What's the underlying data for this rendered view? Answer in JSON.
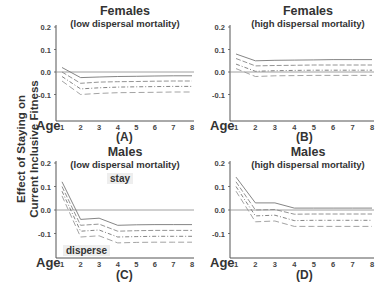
{
  "figure": {
    "y_axis_label_line1": "Effect of Staying on",
    "y_axis_label_line2": "Current Inclusive Fitness",
    "x_axis_label": "Age"
  },
  "panels": [
    {
      "title": "Females",
      "subtitle": "(low dispersal mortality)",
      "label": "(A)"
    },
    {
      "title": "Females",
      "subtitle": "(high dispersal mortality)",
      "label": "(B)"
    },
    {
      "title": "Males",
      "subtitle": "(low dispersal mortality)",
      "label": "(C)",
      "annotations": [
        "stay",
        "disperse"
      ]
    },
    {
      "title": "Males",
      "subtitle": "(high dispersal mortality)",
      "label": "(D)"
    }
  ],
  "chart_data": [
    {
      "type": "line",
      "title": "Females (low dispersal mortality)",
      "panel": "(A)",
      "xlabel": "Age",
      "ylabel": "Effect of Staying on Current Inclusive Fitness",
      "x": [
        1,
        2,
        3,
        4,
        5,
        6,
        7,
        8
      ],
      "xticks": [
        "1",
        "2",
        "3",
        "4",
        "5",
        "6",
        "7",
        "8"
      ],
      "yticks": [
        "0.2",
        "0.1",
        "0.0",
        "-0.1"
      ],
      "ylim": [
        -0.17,
        0.2
      ],
      "reference_line": 0.0,
      "series": [
        {
          "name": "line1",
          "style": "solid",
          "values": [
            0.02,
            -0.025,
            -0.022,
            -0.02,
            -0.019,
            -0.018,
            -0.017,
            -0.017
          ]
        },
        {
          "name": "line2",
          "style": "dashed",
          "values": [
            0.0,
            -0.05,
            -0.045,
            -0.043,
            -0.042,
            -0.041,
            -0.04,
            -0.04
          ]
        },
        {
          "name": "line3",
          "style": "dash-dot",
          "values": [
            -0.02,
            -0.075,
            -0.07,
            -0.067,
            -0.066,
            -0.065,
            -0.064,
            -0.064
          ]
        },
        {
          "name": "line4",
          "style": "long-dash",
          "values": [
            -0.04,
            -0.1,
            -0.095,
            -0.092,
            -0.091,
            -0.09,
            -0.089,
            -0.089
          ]
        }
      ]
    },
    {
      "type": "line",
      "title": "Females (high dispersal mortality)",
      "panel": "(B)",
      "xlabel": "Age",
      "ylabel": "Effect of Staying on Current Inclusive Fitness",
      "x": [
        1,
        2,
        3,
        4,
        5,
        6,
        7,
        8
      ],
      "xticks": [
        "1",
        "2",
        "3",
        "4",
        "5",
        "6",
        "7",
        "8"
      ],
      "yticks": [
        "0.2",
        "0.1",
        "0.0",
        "-0.1"
      ],
      "ylim": [
        -0.17,
        0.2
      ],
      "reference_line": 0.0,
      "series": [
        {
          "name": "line1",
          "style": "solid",
          "values": [
            0.08,
            0.05,
            0.052,
            0.053,
            0.054,
            0.055,
            0.055,
            0.055
          ]
        },
        {
          "name": "line2",
          "style": "dashed",
          "values": [
            0.06,
            0.027,
            0.029,
            0.03,
            0.031,
            0.031,
            0.031,
            0.031
          ]
        },
        {
          "name": "line3",
          "style": "dash-dot",
          "values": [
            0.035,
            0.003,
            0.006,
            0.007,
            0.008,
            0.008,
            0.008,
            0.008
          ]
        },
        {
          "name": "line4",
          "style": "long-dash",
          "values": [
            0.015,
            -0.02,
            -0.017,
            -0.016,
            -0.015,
            -0.015,
            -0.015,
            -0.015
          ]
        }
      ]
    },
    {
      "type": "line",
      "title": "Males (low dispersal mortality)",
      "panel": "(C)",
      "xlabel": "Age",
      "ylabel": "Effect of Staying on Current Inclusive Fitness",
      "x": [
        1,
        2,
        3,
        4,
        5,
        6,
        7,
        8
      ],
      "xticks": [
        "1",
        "2",
        "3",
        "4",
        "5",
        "6",
        "7",
        "8"
      ],
      "yticks": [
        "0.2",
        "0.1",
        "0.0",
        "-0.1"
      ],
      "ylim": [
        -0.2,
        0.2
      ],
      "reference_line": 0.0,
      "annotations": [
        "stay",
        "disperse"
      ],
      "series": [
        {
          "name": "line1",
          "style": "solid",
          "values": [
            0.12,
            -0.04,
            -0.035,
            -0.065,
            -0.063,
            -0.062,
            -0.062,
            -0.062
          ]
        },
        {
          "name": "line2",
          "style": "dashed",
          "values": [
            0.1,
            -0.065,
            -0.06,
            -0.09,
            -0.088,
            -0.087,
            -0.087,
            -0.087
          ]
        },
        {
          "name": "line3",
          "style": "dash-dot",
          "values": [
            0.08,
            -0.09,
            -0.085,
            -0.115,
            -0.113,
            -0.112,
            -0.112,
            -0.112
          ]
        },
        {
          "name": "line4",
          "style": "long-dash",
          "values": [
            0.06,
            -0.115,
            -0.11,
            -0.14,
            -0.138,
            -0.137,
            -0.137,
            -0.137
          ]
        }
      ]
    },
    {
      "type": "line",
      "title": "Males (high dispersal mortality)",
      "panel": "(D)",
      "xlabel": "Age",
      "ylabel": "Effect of Staying on Current Inclusive Fitness",
      "x": [
        1,
        2,
        3,
        4,
        5,
        6,
        7,
        8
      ],
      "xticks": [
        "1",
        "2",
        "3",
        "4",
        "5",
        "6",
        "7",
        "8"
      ],
      "yticks": [
        "0.2",
        "0.1",
        "0.0",
        "-0.1"
      ],
      "ylim": [
        -0.2,
        0.2
      ],
      "reference_line": 0.0,
      "series": [
        {
          "name": "line1",
          "style": "solid",
          "values": [
            0.14,
            0.03,
            0.03,
            0.008,
            0.008,
            0.008,
            0.008,
            0.008
          ]
        },
        {
          "name": "line2",
          "style": "dashed",
          "values": [
            0.12,
            0.0,
            0.002,
            -0.018,
            -0.017,
            -0.017,
            -0.017,
            -0.017
          ]
        },
        {
          "name": "line3",
          "style": "dash-dot",
          "values": [
            0.1,
            -0.025,
            -0.022,
            -0.045,
            -0.044,
            -0.044,
            -0.044,
            -0.044
          ]
        },
        {
          "name": "line4",
          "style": "long-dash",
          "values": [
            0.08,
            -0.05,
            -0.047,
            -0.07,
            -0.07,
            -0.07,
            -0.07,
            -0.07
          ]
        }
      ]
    }
  ]
}
